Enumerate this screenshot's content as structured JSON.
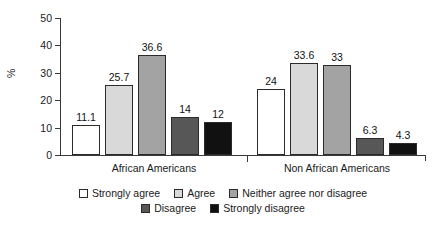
{
  "chart_data": {
    "type": "bar",
    "title": "",
    "subtitle": "",
    "xlabel": "",
    "ylabel": "%",
    "ylim": [
      0,
      50
    ],
    "yticks": [
      0,
      10,
      20,
      30,
      40,
      50
    ],
    "ytick_labels": [
      "0",
      "10",
      "20",
      "30",
      "40",
      "50"
    ],
    "grid": false,
    "legend_position": "bottom-center",
    "orientation": "vertical",
    "grouping": "grouped",
    "categories": [
      "African Americans",
      "Non African Americans"
    ],
    "series": [
      {
        "name": "Strongly agree",
        "color": "#ffffff",
        "values": [
          11.1,
          24
        ],
        "labels": [
          "11.1",
          "24"
        ]
      },
      {
        "name": "Agree",
        "color": "#d9d9d9",
        "values": [
          25.7,
          33.6
        ],
        "labels": [
          "25.7",
          "33.6"
        ]
      },
      {
        "name": "Neither agree nor disagree",
        "color": "#a3a3a3",
        "values": [
          36.6,
          33
        ],
        "labels": [
          "36.6",
          "33"
        ]
      },
      {
        "name": "Disagree",
        "color": "#575757",
        "values": [
          14,
          6.3
        ],
        "labels": [
          "14",
          "6.3"
        ]
      },
      {
        "name": "Strongly disagree",
        "color": "#111111",
        "values": [
          12,
          4.3
        ],
        "labels": [
          "12",
          "4.3"
        ]
      }
    ]
  },
  "axis": {
    "y_title": "%",
    "ticks": [
      "50",
      "40",
      "30",
      "20",
      "10",
      "0"
    ]
  },
  "legend": {
    "row1": [
      "Strongly agree",
      "Agree",
      "Neither agree nor disagree"
    ],
    "row2": [
      "Disagree",
      "Strongly disagree"
    ]
  }
}
